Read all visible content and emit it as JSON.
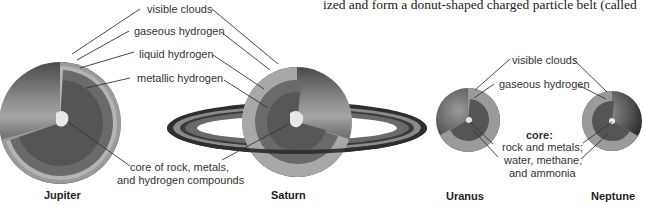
{
  "body_text": "ized and form a donut-shaped charged particle belt (called",
  "jovian_labels": {
    "visible_clouds": "visible clouds",
    "gaseous_hydrogen": "gaseous hydrogen",
    "liquid_hydrogen": "liquid hydrogen",
    "metallic_hydrogen": "metallic hydrogen",
    "core_line1": "core of rock, metals,",
    "core_line2": "and hydrogen compounds"
  },
  "ice_giant_labels": {
    "visible_clouds": "visible clouds",
    "gaseous_hydrogen": "gaseous hydrogen",
    "core_title": "core:",
    "core_line1": "rock and metals;",
    "core_line2": "water, methane,",
    "core_line3": "and ammonia"
  },
  "planets": [
    {
      "name": "Jupiter"
    },
    {
      "name": "Saturn"
    },
    {
      "name": "Uranus"
    },
    {
      "name": "Neptune"
    }
  ],
  "colors": {
    "outer_shell": "#3a3a3a",
    "clouds_layer": "#b8b8b8",
    "gaseous_layer": "#8f8f8f",
    "liquid_layer": "#6a6a6a",
    "metallic_layer": "#555555",
    "core": "#e6e6e6",
    "ring_dark": "#2e2e2e",
    "ring_mid": "#8a8a8a"
  }
}
